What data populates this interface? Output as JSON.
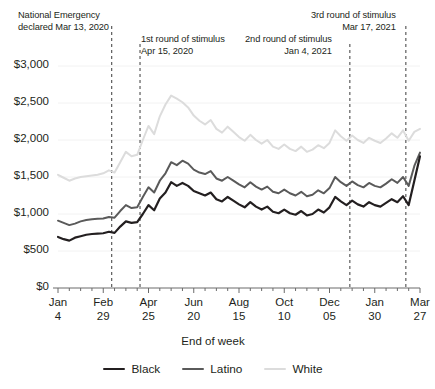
{
  "chart_data": {
    "type": "line",
    "title": "",
    "xlabel": "End of week",
    "ylabel": "",
    "ylim": [
      0,
      3000
    ],
    "ytick_values": [
      0,
      500,
      1000,
      1500,
      2000,
      2500,
      3000
    ],
    "ytick_labels": [
      "$0",
      "$500",
      "$1,000",
      "$1,500",
      "$2,000",
      "$2,500",
      "$3,000"
    ],
    "xtick_labels": [
      {
        "month": "Jan",
        "day": "4"
      },
      {
        "month": "Feb",
        "day": "29"
      },
      {
        "month": "Apr",
        "day": "25"
      },
      {
        "month": "Jun",
        "day": "20"
      },
      {
        "month": "Aug",
        "day": "15"
      },
      {
        "month": "Oct",
        "day": "10"
      },
      {
        "month": "Dec",
        "day": "05"
      },
      {
        "month": "Jan",
        "day": "30"
      },
      {
        "month": "Mar",
        "day": "27"
      }
    ],
    "xtick_indices": [
      0,
      8,
      16,
      24,
      32,
      40,
      48,
      56,
      64
    ],
    "x_count": 65,
    "grid": false,
    "legend_position": "bottom",
    "series": [
      {
        "name": "Black",
        "color": "#231f20",
        "width": 2.2,
        "values": [
          690,
          660,
          640,
          680,
          700,
          720,
          730,
          735,
          740,
          760,
          745,
          830,
          900,
          880,
          890,
          1000,
          1120,
          1050,
          1210,
          1290,
          1430,
          1380,
          1420,
          1380,
          1310,
          1280,
          1250,
          1290,
          1200,
          1170,
          1230,
          1180,
          1130,
          1090,
          1160,
          1100,
          1060,
          1100,
          1030,
          1010,
          1060,
          1010,
          990,
          1040,
          980,
          1000,
          1060,
          1020,
          1090,
          1230,
          1170,
          1120,
          1180,
          1130,
          1100,
          1160,
          1120,
          1100,
          1150,
          1200,
          1160,
          1240,
          1120,
          1450,
          1780
        ]
      },
      {
        "name": "Latino",
        "color": "#5a5a5a",
        "width": 2.0,
        "values": [
          910,
          880,
          850,
          870,
          900,
          920,
          930,
          935,
          940,
          960,
          950,
          1040,
          1120,
          1080,
          1090,
          1230,
          1360,
          1290,
          1450,
          1550,
          1700,
          1660,
          1720,
          1680,
          1600,
          1560,
          1540,
          1580,
          1480,
          1450,
          1500,
          1450,
          1400,
          1360,
          1430,
          1370,
          1330,
          1370,
          1300,
          1280,
          1330,
          1280,
          1250,
          1300,
          1240,
          1260,
          1320,
          1280,
          1350,
          1500,
          1430,
          1380,
          1440,
          1390,
          1360,
          1420,
          1380,
          1360,
          1410,
          1470,
          1420,
          1500,
          1380,
          1650,
          1830
        ]
      },
      {
        "name": "White",
        "color": "#dcdcdc",
        "width": 2.0,
        "values": [
          1530,
          1490,
          1450,
          1480,
          1500,
          1510,
          1520,
          1530,
          1550,
          1590,
          1560,
          1700,
          1840,
          1780,
          1800,
          2000,
          2190,
          2080,
          2320,
          2480,
          2600,
          2560,
          2510,
          2440,
          2330,
          2260,
          2210,
          2270,
          2150,
          2100,
          2180,
          2110,
          2040,
          1990,
          2070,
          2000,
          1950,
          2000,
          1910,
          1880,
          1940,
          1880,
          1850,
          1910,
          1840,
          1870,
          1930,
          1890,
          1960,
          2130,
          2050,
          1990,
          2060,
          2000,
          1960,
          2030,
          1990,
          1960,
          2020,
          2090,
          2030,
          2130,
          1990,
          2110,
          2150
        ]
      }
    ],
    "annotations": [
      {
        "id": "national-emergency",
        "line1": "National Emergency",
        "line2": "declared Mar 13, 2020",
        "x_index": 9.5,
        "align": "left",
        "text_left": 18,
        "text_top": 10,
        "line_top": 26
      },
      {
        "id": "first-stimulus",
        "line1": "1st round of stimulus",
        "line2": "Apr 15, 2020",
        "x_index": 14.5,
        "align": "left",
        "text_left": 141,
        "text_top": 34,
        "line_top": 44
      },
      {
        "id": "second-stimulus",
        "line1": "2nd round of stimulus",
        "line2": "Jan 4, 2021",
        "x_index": 51.6,
        "align": "right",
        "text_left": 245,
        "text_top": 34,
        "line_top": 44
      },
      {
        "id": "third-stimulus",
        "line1": "3rd round of stimulus",
        "line2": "Mar 17, 2021",
        "x_index": 61.5,
        "align": "right",
        "text_left": 311,
        "text_top": 10,
        "line_top": 26
      }
    ]
  },
  "legend": {
    "items": [
      {
        "label": "Black",
        "color": "#231f20"
      },
      {
        "label": "Latino",
        "color": "#5a5a5a"
      },
      {
        "label": "White",
        "color": "#dcdcdc"
      }
    ]
  },
  "axis": {
    "x_title": "End of week"
  }
}
